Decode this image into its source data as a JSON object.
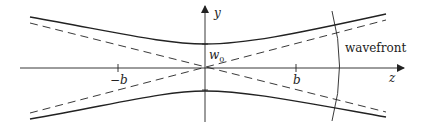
{
  "diagram": {
    "labels": {
      "y_axis": "y",
      "z_axis": "z",
      "waist": "w",
      "waist_subscript": "0",
      "neg_rayleigh": "−b",
      "pos_rayleigh": "b",
      "wavefront": "wavefront"
    },
    "colors": {
      "line": "#222222",
      "background": "#ffffff"
    }
  }
}
